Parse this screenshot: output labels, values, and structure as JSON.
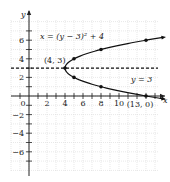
{
  "chart_data": {
    "type": "line",
    "title": "",
    "xlabel": "x",
    "ylabel": "y",
    "xlim": [
      -2,
      14
    ],
    "ylim": [
      -8,
      8
    ],
    "grid": true,
    "x_ticks": [
      {
        "value": 0,
        "label": "0"
      },
      {
        "value": 2,
        "label": "2"
      },
      {
        "value": 4,
        "label": "4"
      },
      {
        "value": 6,
        "label": "6"
      },
      {
        "value": 8,
        "label": "8"
      },
      {
        "value": 10,
        "label": "10"
      }
    ],
    "y_ticks": [
      {
        "value": 6,
        "label": "6"
      },
      {
        "value": 4,
        "label": "4"
      },
      {
        "value": 2,
        "label": "2"
      },
      {
        "value": -2,
        "label": "−2"
      },
      {
        "value": -4,
        "label": "−4"
      },
      {
        "value": -6,
        "label": "−6"
      }
    ],
    "series": [
      {
        "name": "x = (y − 3)² + 4",
        "equation_label": "x = (y − 3)² + 4",
        "kind": "parabola-x-of-y",
        "vertex": [
          4,
          3
        ],
        "y_range": [
          -0.3,
          6.3
        ],
        "points": [
          [
            13,
            0
          ],
          [
            8,
            1
          ],
          [
            5,
            2
          ],
          [
            4,
            3
          ],
          [
            5,
            4
          ],
          [
            8,
            5
          ],
          [
            13,
            6
          ]
        ]
      },
      {
        "name": "y = 3",
        "equation_label": "y = 3",
        "kind": "horizontal-dashed",
        "y": 3
      }
    ],
    "annotations": [
      {
        "text": "(4, 3)",
        "at": [
          4,
          3
        ]
      },
      {
        "text": "(13, 0)",
        "at": [
          13,
          0
        ]
      }
    ]
  }
}
